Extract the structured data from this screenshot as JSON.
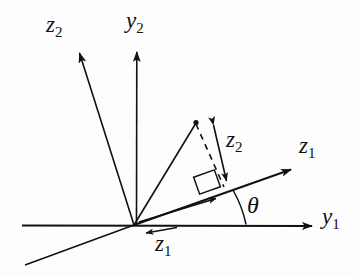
{
  "figure": {
    "background_color": "#fdfdfd",
    "stroke_color": "#111111",
    "width": 359,
    "height": 277
  },
  "labels": {
    "z2_upper_left": {
      "base": "z",
      "sub": "2"
    },
    "y2_vertical": {
      "base": "y",
      "sub": "2"
    },
    "z1_upper_right": {
      "base": "z",
      "sub": "1"
    },
    "y1_horizontal": {
      "base": "y",
      "sub": "1"
    },
    "z2_component": {
      "base": "z",
      "sub": "2"
    },
    "z1_lower_left": {
      "base": "z",
      "sub": "1"
    },
    "theta": "θ"
  },
  "geometry": {
    "origin": {
      "x": 134,
      "y": 225
    },
    "y1_axis_tip": {
      "x": 317,
      "y": 226
    },
    "y1_axis_start": {
      "x": 22,
      "y": 225
    },
    "y2_axis_tip": {
      "x": 137,
      "y": 44
    },
    "z1_axis_tip": {
      "x": 296,
      "y": 168
    },
    "z1_axis_back_end": {
      "x": 25,
      "y": 265
    },
    "z2_axis_tip": {
      "x": 77,
      "y": 45
    },
    "point": {
      "x": 196,
      "y": 123
    },
    "foot_of_perpendicular": {
      "x": 226,
      "y": 187
    },
    "z2_component_arrow_top": {
      "x": 211,
      "y": 119
    },
    "z2_component_arrow_bottom": {
      "x": 228,
      "y": 186
    },
    "inner_z1_arrow_tip": {
      "x": 222,
      "y": 197
    },
    "theta_arc_start": {
      "x": 246,
      "y": 225
    },
    "theta_arc_end": {
      "x": 233,
      "y": 190
    },
    "z1_lower_arrow_tip": {
      "x": 141,
      "y": 234
    },
    "z1_lower_arrow_tail": {
      "x": 176,
      "y": 228
    },
    "right_angle_marker_center": {
      "x": 207,
      "y": 182
    }
  },
  "measurements": {
    "rotation_angle_symbol": "θ",
    "rotation_angle_degrees_approx": 18
  }
}
